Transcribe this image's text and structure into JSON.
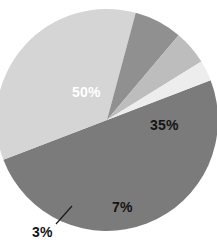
{
  "chart_data": {
    "type": "pie",
    "title": "",
    "subtitle": "",
    "xlabel": "",
    "ylabel": "",
    "grid": false,
    "legend": "none",
    "background_color": "#ffffff",
    "categories": [
      "50%",
      "35%",
      "7%",
      "5%",
      "3%"
    ],
    "values": [
      50,
      35,
      7,
      5,
      3
    ],
    "total": 100,
    "units": "percent",
    "start_angle_deg": -21,
    "direction": "clockwise",
    "center": {
      "x": 107,
      "y": 120
    },
    "radius": 111,
    "slices": [
      {
        "label": "50%",
        "value": 50,
        "color": "#7b7b7b",
        "label_visible": true,
        "label_placement": "inside",
        "label_color": "#ffffff",
        "label_x": 72,
        "label_y": 85,
        "leader_line": false
      },
      {
        "label": "35%",
        "value": 35,
        "color": "#d5d5d5",
        "label_visible": true,
        "label_placement": "inside",
        "label_color": "#141414",
        "label_x": 150,
        "label_y": 118,
        "leader_line": false
      },
      {
        "label": "7%",
        "value": 7,
        "color": "#909090",
        "label_visible": true,
        "label_placement": "inside",
        "label_color": "#141414",
        "label_x": 112,
        "label_y": 200,
        "leader_line": false
      },
      {
        "label": "",
        "value": 5,
        "color": "#bdbdbd",
        "label_visible": false,
        "label_placement": "none",
        "label_color": "",
        "label_x": 0,
        "label_y": 0,
        "leader_line": false
      },
      {
        "label": "3%",
        "value": 3,
        "color": "#ededed",
        "label_visible": true,
        "label_placement": "outside",
        "label_color": "#141414",
        "label_x": 32,
        "label_y": 225,
        "leader_line": true,
        "leader_from": {
          "x": 72,
          "y": 206
        },
        "leader_to": {
          "x": 56,
          "y": 224
        }
      }
    ]
  }
}
